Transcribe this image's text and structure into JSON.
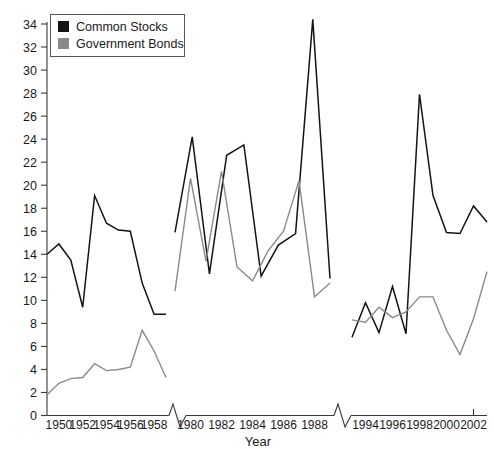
{
  "chart_data": {
    "type": "line",
    "title": "",
    "xlabel": "Year",
    "ylabel": "",
    "ylim": [
      0,
      34
    ],
    "y_ticks": [
      0,
      2,
      4,
      6,
      8,
      10,
      12,
      14,
      16,
      18,
      20,
      22,
      24,
      26,
      28,
      30,
      32,
      34
    ],
    "grid": false,
    "legend_position": "top-left",
    "axis_breaks": 2,
    "x_tick_labels": [
      "1950",
      "1952",
      "1954",
      "1956",
      "1958",
      "1980",
      "1982",
      "1984",
      "1986",
      "1988",
      "1994",
      "1996",
      "1998",
      "2000",
      "2002"
    ],
    "segments": [
      {
        "name": "1950s",
        "x": [
          1950,
          1951,
          1952,
          1953,
          1954,
          1955,
          1956,
          1957,
          1958,
          1959
        ],
        "series": [
          {
            "name": "Common Stocks",
            "color": "#141414",
            "values": [
              14.0,
              14.9,
              13.5,
              9.4,
              19.1,
              16.7,
              16.1,
              16.0,
              11.5,
              8.8,
              8.8
            ]
          },
          {
            "name": "Government Bonds",
            "color": "#8a8a8a",
            "values": [
              1.8,
              2.8,
              3.2,
              3.3,
              4.5,
              3.9,
              4.0,
              4.2,
              7.4,
              5.6,
              3.3
            ]
          }
        ]
      },
      {
        "name": "1980s",
        "x": [
          1979,
          1980,
          1981,
          1982,
          1983,
          1984,
          1985,
          1986,
          1987,
          1988
        ],
        "series": [
          {
            "name": "Common Stocks",
            "color": "#141414",
            "values": [
              15.9,
              24.2,
              12.3,
              22.6,
              23.5,
              12.1,
              14.8,
              15.8,
              34.4,
              11.9
            ]
          },
          {
            "name": "Government Bonds",
            "color": "#8a8a8a",
            "values": [
              10.8,
              20.6,
              13.4,
              21.2,
              12.9,
              11.7,
              14.3,
              16.0,
              20.4,
              10.3,
              11.5
            ]
          }
        ]
      },
      {
        "name": "1990s-2000s",
        "x": [
          1993,
          1994,
          1995,
          1996,
          1997,
          1998,
          1999,
          2000,
          2001,
          2002
        ],
        "series": [
          {
            "name": "Common Stocks",
            "color": "#141414",
            "values": [
              6.8,
              9.8,
              7.2,
              11.2,
              7.1,
              27.9,
              19.1,
              15.9,
              15.8,
              18.2,
              16.8
            ]
          },
          {
            "name": "Government Bonds",
            "color": "#8a8a8a",
            "values": [
              8.3,
              8.1,
              9.4,
              8.5,
              9.0,
              10.3,
              10.3,
              7.4,
              5.3,
              8.4,
              12.5
            ]
          }
        ]
      }
    ],
    "legend": [
      {
        "label": "Common Stocks",
        "color": "#141414",
        "marker": "square-black"
      },
      {
        "label": "Government Bonds",
        "color": "#8a8a8a",
        "marker": "square-gray"
      }
    ]
  },
  "colors": {
    "common_stocks": "#141414",
    "government_bonds": "#8a8a8a",
    "axis": "#3a3a3a",
    "background": "#ffffff"
  }
}
